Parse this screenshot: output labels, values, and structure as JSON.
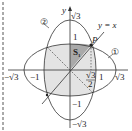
{
  "diagram": {
    "axes": {
      "x_label": "x",
      "y_label": "y"
    },
    "line": {
      "label": "y = x"
    },
    "point": {
      "label": "P"
    },
    "region": {
      "label": "S",
      "subscript": "1"
    },
    "curves": [
      {
        "id": "1",
        "label": "①"
      },
      {
        "id": "2",
        "label": "②"
      }
    ],
    "ticks": {
      "x_neg_sqrt3": "−√3",
      "x_neg_1": "−1",
      "x_1": "1",
      "x_sqrt3": "√3",
      "x_sqrt3_over_2_num": "√3",
      "x_sqrt3_over_2_den": "2",
      "y_sqrt3": "√3",
      "y_1": "1",
      "y_neg_1": "−1",
      "y_neg_sqrt3": "−√3"
    },
    "colors": {
      "shade_light": "#e3e3e3",
      "shade_dark": "#a9a9a9",
      "stroke": "#333333",
      "border": "#555555"
    }
  }
}
